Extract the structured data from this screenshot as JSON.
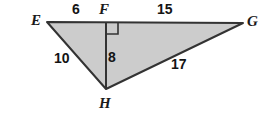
{
  "figure": {
    "kind": "geometry-diagram",
    "background_color": "#ffffff",
    "fill_color": "#cccccc",
    "stroke_color": "#333333",
    "label_color": "#1a1a1a",
    "vertices": [
      {
        "name": "E",
        "label": "E",
        "x": 47,
        "y": 22,
        "label_x": 31,
        "label_y": 13
      },
      {
        "name": "F",
        "label": "F",
        "x": 106,
        "y": 22,
        "label_x": 99,
        "label_y": 2
      },
      {
        "name": "G",
        "label": "G",
        "x": 243,
        "y": 23,
        "label_x": 247,
        "label_y": 14
      },
      {
        "name": "H",
        "label": "H",
        "x": 106,
        "y": 89,
        "label_x": 99,
        "label_y": 96
      }
    ],
    "segments": [
      {
        "name": "EF",
        "from": "E",
        "to": "F",
        "measure": "6",
        "label_x": 72,
        "label_y": 2
      },
      {
        "name": "FG",
        "from": "F",
        "to": "G",
        "measure": "15",
        "label_x": 157,
        "label_y": 2
      },
      {
        "name": "EH",
        "from": "E",
        "to": "H",
        "measure": "10",
        "label_x": 54,
        "label_y": 51
      },
      {
        "name": "FH",
        "from": "F",
        "to": "H",
        "measure": "8",
        "label_x": 108,
        "label_y": 50
      },
      {
        "name": "HG",
        "from": "H",
        "to": "G",
        "measure": "17",
        "label_x": 171,
        "label_y": 57
      }
    ],
    "right_angle": {
      "at": "F",
      "x": 106,
      "y": 22,
      "size": 11,
      "direction": "right-down"
    }
  }
}
